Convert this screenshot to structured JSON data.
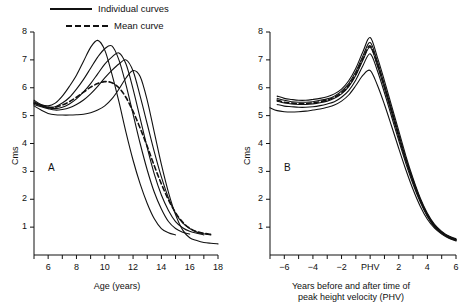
{
  "figure": {
    "background": "#ffffff",
    "ink": "#111111"
  },
  "legend": {
    "position": "top-left",
    "entries": [
      {
        "key": "individual",
        "label": "Individual curves",
        "style": "solid"
      },
      {
        "key": "mean",
        "label": "Mean curve",
        "style": "dashed"
      }
    ]
  },
  "chart_data": [
    {
      "id": "panel-a",
      "type": "line",
      "panel_letter": "A",
      "title": "",
      "xlabel": "Age (years)",
      "ylabel": "Cms",
      "xlim": [
        5,
        18
      ],
      "ylim": [
        0,
        8
      ],
      "xticks": [
        5,
        6,
        7,
        8,
        9,
        10,
        11,
        12,
        13,
        14,
        15,
        16,
        17,
        18
      ],
      "xtick_labels": [
        "",
        "6",
        "",
        "8",
        "",
        "10",
        "",
        "12",
        "",
        "14",
        "",
        "16",
        "",
        "18"
      ],
      "yticks": [
        1,
        2,
        3,
        4,
        5,
        6,
        7,
        8
      ],
      "ytick_labels": [
        "1",
        "2",
        "3",
        "4",
        "5",
        "6",
        "7",
        "8"
      ],
      "grid": false,
      "legend_position": "above-axes-left",
      "series": [
        {
          "name": "Individual curve 1",
          "style": "solid",
          "x": [
            5.0,
            5.5,
            6.0,
            6.5,
            7.0,
            7.5,
            8.0,
            8.5,
            9.0,
            9.5,
            10.0,
            10.5,
            11.0,
            11.5,
            12.0,
            12.5,
            13.0,
            13.5,
            14.0,
            14.5,
            15.0
          ],
          "y": [
            5.55,
            5.4,
            5.35,
            5.45,
            5.7,
            6.05,
            6.45,
            6.95,
            7.45,
            7.7,
            7.35,
            6.5,
            5.5,
            4.4,
            3.4,
            2.55,
            1.85,
            1.3,
            0.95,
            0.8,
            0.72
          ]
        },
        {
          "name": "Individual curve 2",
          "style": "solid",
          "x": [
            5.0,
            5.5,
            6.0,
            6.5,
            7.0,
            7.5,
            8.0,
            8.5,
            9.0,
            9.5,
            10.0,
            10.5,
            11.0,
            11.5,
            12.0,
            12.5,
            13.0,
            13.5,
            14.0,
            14.5,
            15.0,
            15.5,
            16.0
          ],
          "y": [
            5.5,
            5.38,
            5.3,
            5.32,
            5.45,
            5.65,
            5.95,
            6.3,
            6.7,
            7.1,
            7.4,
            7.5,
            7.0,
            6.1,
            5.05,
            4.0,
            3.05,
            2.25,
            1.65,
            1.2,
            0.95,
            0.82,
            0.75
          ]
        },
        {
          "name": "Individual curve 3",
          "style": "solid",
          "x": [
            5.0,
            5.5,
            6.0,
            6.5,
            7.0,
            7.5,
            8.0,
            8.5,
            9.0,
            9.5,
            10.0,
            10.5,
            11.0,
            11.5,
            12.0,
            12.5,
            13.0,
            13.5,
            14.0,
            14.5,
            15.0,
            15.5,
            16.0,
            16.5,
            17.0
          ],
          "y": [
            5.45,
            5.35,
            5.28,
            5.25,
            5.3,
            5.42,
            5.6,
            5.85,
            6.15,
            6.5,
            6.85,
            7.1,
            7.25,
            6.85,
            5.95,
            4.9,
            3.85,
            2.9,
            2.15,
            1.6,
            1.2,
            0.98,
            0.85,
            0.78,
            0.72
          ]
        },
        {
          "name": "Individual curve 4",
          "style": "solid",
          "x": [
            5.0,
            5.5,
            6.0,
            6.5,
            7.0,
            7.5,
            8.0,
            8.5,
            9.0,
            9.5,
            10.0,
            10.5,
            11.0,
            11.5,
            12.0,
            12.5,
            13.0,
            13.5,
            14.0,
            14.5,
            15.0,
            15.5,
            16.0,
            16.5,
            17.0,
            17.5
          ],
          "y": [
            5.4,
            5.32,
            5.25,
            5.2,
            5.22,
            5.28,
            5.4,
            5.56,
            5.78,
            6.05,
            6.35,
            6.62,
            6.85,
            7.0,
            6.6,
            5.7,
            4.7,
            3.7,
            2.8,
            2.05,
            1.5,
            1.15,
            0.95,
            0.82,
            0.76,
            0.72
          ]
        },
        {
          "name": "Individual curve 5",
          "style": "solid",
          "x": [
            5.0,
            5.5,
            6.0,
            6.5,
            7.0,
            7.5,
            8.0,
            8.5,
            9.0,
            9.5,
            10.0,
            10.5,
            11.0,
            11.5,
            12.0,
            12.5,
            13.0,
            13.5,
            14.0,
            14.5,
            15.0,
            15.5,
            16.0,
            16.5,
            17.0,
            17.5,
            18.0
          ],
          "y": [
            5.35,
            5.2,
            5.08,
            5.03,
            5.02,
            5.02,
            5.03,
            5.05,
            5.1,
            5.2,
            5.35,
            5.6,
            5.95,
            6.35,
            6.62,
            6.4,
            5.55,
            4.4,
            3.25,
            2.25,
            1.45,
            0.9,
            0.62,
            0.52,
            0.45,
            0.42,
            0.4
          ]
        },
        {
          "name": "Mean curve",
          "style": "dashed",
          "x": [
            5.0,
            5.5,
            6.0,
            6.5,
            7.0,
            7.5,
            8.0,
            8.5,
            9.0,
            9.5,
            10.0,
            10.5,
            11.0,
            11.5,
            12.0,
            12.5,
            13.0,
            13.5,
            14.0,
            14.5,
            15.0,
            15.5,
            16.0,
            16.5,
            17.0,
            17.5
          ],
          "y": [
            5.45,
            5.36,
            5.3,
            5.3,
            5.38,
            5.5,
            5.66,
            5.84,
            6.02,
            6.15,
            6.22,
            6.18,
            6.0,
            5.65,
            5.15,
            4.55,
            3.9,
            3.2,
            2.55,
            1.98,
            1.52,
            1.18,
            0.96,
            0.84,
            0.78,
            0.74
          ]
        }
      ]
    },
    {
      "id": "panel-b",
      "type": "line",
      "panel_letter": "B",
      "title": "",
      "xlabel": "Years before and after time of peak height velocity (PHV)",
      "xlabel_line1": "Years before and after time of",
      "xlabel_line2": "peak height velocity (PHV)",
      "ylabel": "Cms",
      "xlim": [
        -7,
        6
      ],
      "ylim": [
        0,
        8
      ],
      "xticks": [
        -7,
        -6,
        -5,
        -4,
        -3,
        -2,
        -1,
        0,
        1,
        2,
        3,
        4,
        5,
        6
      ],
      "xtick_labels": [
        "",
        "−6",
        "",
        "−4",
        "",
        "−2",
        "",
        "PHV",
        "",
        "2",
        "",
        "4",
        "",
        "6"
      ],
      "yticks": [
        1,
        2,
        3,
        4,
        5,
        6,
        7,
        8
      ],
      "ytick_labels": [
        "1",
        "2",
        "3",
        "4",
        "5",
        "6",
        "7",
        "8"
      ],
      "grid": false,
      "series": [
        {
          "name": "Individual curve 1",
          "style": "solid",
          "x": [
            -6.5,
            -6.0,
            -5.5,
            -5.0,
            -4.5,
            -4.0,
            -3.5,
            -3.0,
            -2.5,
            -2.0,
            -1.5,
            -1.0,
            -0.5,
            0.0,
            0.5,
            1.0,
            1.5,
            2.0,
            2.5,
            3.0,
            3.5,
            4.0,
            4.5,
            5.0,
            5.5,
            6.0
          ],
          "y": [
            5.7,
            5.62,
            5.58,
            5.55,
            5.55,
            5.58,
            5.62,
            5.68,
            5.78,
            5.95,
            6.25,
            6.7,
            7.3,
            7.8,
            7.1,
            6.25,
            5.35,
            4.45,
            3.55,
            2.75,
            2.05,
            1.5,
            1.1,
            0.85,
            0.68,
            0.58
          ]
        },
        {
          "name": "Individual curve 2",
          "style": "solid",
          "x": [
            -6.5,
            -6.0,
            -5.5,
            -5.0,
            -4.5,
            -4.0,
            -3.5,
            -3.0,
            -2.5,
            -2.0,
            -1.5,
            -1.0,
            -0.5,
            0.0,
            0.5,
            1.0,
            1.5,
            2.0,
            2.5,
            3.0,
            3.5,
            4.0,
            4.5,
            5.0,
            5.5,
            6.0
          ],
          "y": [
            5.62,
            5.55,
            5.5,
            5.48,
            5.48,
            5.5,
            5.55,
            5.6,
            5.7,
            5.88,
            6.15,
            6.58,
            7.15,
            7.62,
            6.95,
            6.1,
            5.22,
            4.32,
            3.45,
            2.68,
            2.0,
            1.45,
            1.06,
            0.82,
            0.66,
            0.56
          ]
        },
        {
          "name": "Individual curve 3",
          "style": "solid",
          "x": [
            -6.5,
            -6.0,
            -5.5,
            -5.0,
            -4.5,
            -4.0,
            -3.5,
            -3.0,
            -2.5,
            -2.0,
            -1.5,
            -1.0,
            -0.5,
            0.0,
            0.5,
            1.0,
            1.5,
            2.0,
            2.5,
            3.0,
            3.5,
            4.0,
            4.5,
            5.0,
            5.5,
            6.0
          ],
          "y": [
            5.52,
            5.45,
            5.42,
            5.4,
            5.4,
            5.42,
            5.46,
            5.52,
            5.62,
            5.78,
            6.04,
            6.45,
            7.0,
            7.45,
            6.8,
            5.98,
            5.1,
            4.22,
            3.38,
            2.62,
            1.95,
            1.42,
            1.03,
            0.8,
            0.64,
            0.54
          ]
        },
        {
          "name": "Individual curve 4",
          "style": "solid",
          "x": [
            -6.5,
            -6.0,
            -5.5,
            -5.0,
            -4.5,
            -4.0,
            -3.5,
            -3.0,
            -2.5,
            -2.0,
            -1.5,
            -1.0,
            -0.5,
            0.0,
            0.5,
            1.0,
            1.5,
            2.0,
            2.5,
            3.0,
            3.5,
            4.0,
            4.5,
            5.0,
            5.5,
            6.0
          ],
          "y": [
            5.4,
            5.34,
            5.32,
            5.3,
            5.3,
            5.32,
            5.36,
            5.42,
            5.5,
            5.66,
            5.9,
            6.28,
            6.8,
            7.22,
            6.62,
            5.82,
            4.96,
            4.1,
            3.28,
            2.54,
            1.9,
            1.38,
            1.0,
            0.78,
            0.62,
            0.52
          ]
        },
        {
          "name": "Individual curve 5",
          "style": "solid",
          "x": [
            -7.0,
            -6.5,
            -6.0,
            -5.5,
            -5.0,
            -4.5,
            -4.0,
            -3.5,
            -3.0,
            -2.5,
            -2.0,
            -1.5,
            -1.0,
            -0.5,
            0.0,
            0.5,
            1.0,
            1.5,
            2.0,
            2.5,
            3.0,
            3.5,
            4.0,
            4.5,
            5.0,
            5.5,
            6.0
          ],
          "y": [
            5.28,
            5.18,
            5.14,
            5.13,
            5.14,
            5.16,
            5.2,
            5.24,
            5.3,
            5.38,
            5.52,
            5.74,
            6.08,
            6.45,
            6.62,
            6.1,
            5.4,
            4.62,
            3.82,
            3.05,
            2.35,
            1.75,
            1.28,
            0.96,
            0.75,
            0.6,
            0.5
          ]
        },
        {
          "name": "Mean curve",
          "style": "dashed",
          "x": [
            -6.5,
            -6.0,
            -5.5,
            -5.0,
            -4.5,
            -4.0,
            -3.5,
            -3.0,
            -2.5,
            -2.0,
            -1.5,
            -1.0,
            -0.5,
            0.0,
            0.5,
            1.0,
            1.5,
            2.0,
            2.5,
            3.0,
            3.5,
            4.0,
            4.5,
            5.0,
            5.5,
            6.0
          ],
          "y": [
            5.56,
            5.48,
            5.45,
            5.43,
            5.43,
            5.46,
            5.5,
            5.56,
            5.66,
            5.82,
            6.08,
            6.5,
            7.05,
            7.5,
            6.86,
            6.04,
            5.16,
            4.28,
            3.42,
            2.66,
            1.98,
            1.44,
            1.05,
            0.81,
            0.65,
            0.55
          ]
        }
      ]
    }
  ]
}
